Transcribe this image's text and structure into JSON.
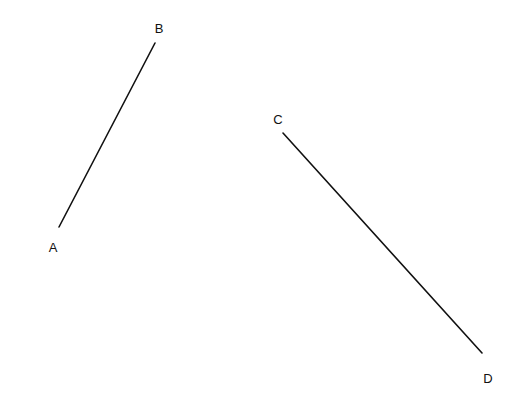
{
  "diagram": {
    "background": "#ffffff",
    "stroke_color": "#111111",
    "points": {
      "A": {
        "label": "A",
        "x": 59,
        "y": 227,
        "label_x": 53,
        "label_y": 252
      },
      "B": {
        "label": "B",
        "x": 155,
        "y": 43,
        "label_x": 159,
        "label_y": 33
      },
      "C": {
        "label": "C",
        "x": 283,
        "y": 133,
        "label_x": 278,
        "label_y": 124
      },
      "D": {
        "label": "D",
        "x": 482,
        "y": 353,
        "label_x": 488,
        "label_y": 383
      }
    },
    "segments": [
      {
        "name": "AB",
        "from": "A",
        "to": "B"
      },
      {
        "name": "CD",
        "from": "C",
        "to": "D"
      }
    ]
  }
}
